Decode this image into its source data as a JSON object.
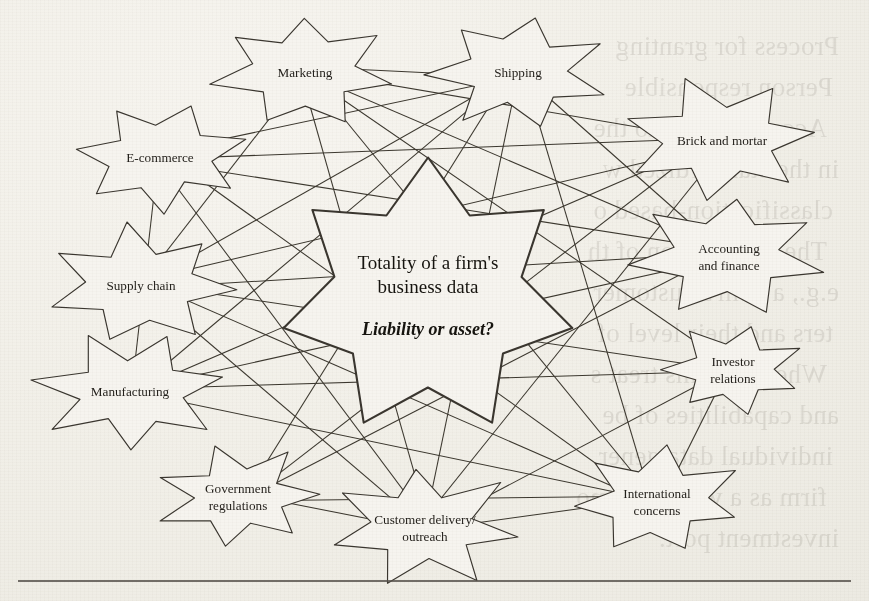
{
  "figure": {
    "kind": "network-diagram",
    "center_node": {
      "line1": "Totality of a firm's",
      "line2": "business data",
      "line3": "Liability or asset?"
    },
    "nodes": [
      {
        "id": "marketing",
        "label_line1": "Marketing",
        "label_line2": "",
        "cx": 305,
        "cy": 72,
        "r_outer": 92,
        "r_inner": 52
      },
      {
        "id": "shipping",
        "label_line1": "Shipping",
        "label_line2": "",
        "cx": 518,
        "cy": 72,
        "r_outer": 92,
        "r_inner": 52
      },
      {
        "id": "ecommerce",
        "label_line1": "E-commerce",
        "label_line2": "",
        "cx": 160,
        "cy": 157,
        "r_outer": 90,
        "r_inner": 50
      },
      {
        "id": "brick",
        "label_line1": "Brick and mortar",
        "label_line2": "",
        "cx": 722,
        "cy": 140,
        "r_outer": 100,
        "r_inner": 56
      },
      {
        "id": "supply",
        "label_line1": "Supply chain",
        "label_line2": "",
        "cx": 141,
        "cy": 285,
        "r_outer": 96,
        "r_inner": 54
      },
      {
        "id": "accounting",
        "label_line1": "Accounting",
        "label_line2": "and finance",
        "cx": 729,
        "cy": 256,
        "r_outer": 96,
        "r_inner": 54
      },
      {
        "id": "investor",
        "label_line1": "Investor",
        "label_line2": "relations",
        "cx": 733,
        "cy": 369,
        "r_outer": 73,
        "r_inner": 41
      },
      {
        "id": "manufacturing",
        "label_line1": "Manufacturing",
        "label_line2": "",
        "cx": 130,
        "cy": 391,
        "r_outer": 94,
        "r_inner": 52
      },
      {
        "id": "government",
        "label_line1": "Government",
        "label_line2": "regulations",
        "cx": 238,
        "cy": 496,
        "r_outer": 82,
        "r_inner": 46
      },
      {
        "id": "customer",
        "label_line1": "Customer delivery/",
        "label_line2": "outreach",
        "cx": 425,
        "cy": 527,
        "r_outer": 98,
        "r_inner": 52
      },
      {
        "id": "international",
        "label_line1": "International",
        "label_line2": "concerns",
        "cx": 657,
        "cy": 501,
        "r_outer": 87,
        "r_inner": 49
      }
    ],
    "center": {
      "cx": 428,
      "cy": 297,
      "r_outer": 148,
      "r_inner": 96
    },
    "edges": [
      [
        "marketing",
        "shipping"
      ],
      [
        "marketing",
        "brick"
      ],
      [
        "marketing",
        "accounting"
      ],
      [
        "marketing",
        "international"
      ],
      [
        "marketing",
        "customer"
      ],
      [
        "marketing",
        "investor"
      ],
      [
        "shipping",
        "ecommerce"
      ],
      [
        "shipping",
        "supply"
      ],
      [
        "shipping",
        "manufacturing"
      ],
      [
        "shipping",
        "customer"
      ],
      [
        "shipping",
        "international"
      ],
      [
        "shipping",
        "government"
      ],
      [
        "ecommerce",
        "brick"
      ],
      [
        "ecommerce",
        "accounting"
      ],
      [
        "ecommerce",
        "international"
      ],
      [
        "ecommerce",
        "customer"
      ],
      [
        "brick",
        "supply"
      ],
      [
        "brick",
        "manufacturing"
      ],
      [
        "brick",
        "customer"
      ],
      [
        "supply",
        "accounting"
      ],
      [
        "supply",
        "international"
      ],
      [
        "supply",
        "investor"
      ],
      [
        "accounting",
        "manufacturing"
      ],
      [
        "accounting",
        "government"
      ],
      [
        "manufacturing",
        "investor"
      ],
      [
        "manufacturing",
        "international"
      ],
      [
        "government",
        "international"
      ],
      [
        "government",
        "customer"
      ],
      [
        "customer",
        "investor"
      ],
      [
        "customer",
        "international"
      ],
      [
        "investor",
        "international"
      ],
      [
        "marketing",
        "supply"
      ],
      [
        "shipping",
        "accounting"
      ],
      [
        "brick",
        "government"
      ],
      [
        "ecommerce",
        "manufacturing"
      ],
      [
        "supply",
        "customer"
      ]
    ],
    "colors": {
      "paper": "#f4f2ec",
      "ink": "#211e19",
      "stroke": "#3a362f",
      "rule": "#55504a"
    }
  },
  "bleed_through": {
    "note": "faint mirrored text showing through from the reverse side of the printed page",
    "lines": [
      "Process for granting",
      "Person responsible",
      "Access control to the",
      "in the standardized w",
      "classification-based o",
      "The aggregation of th",
      "e.g., a firm's customer",
      "ters and their level of",
      "Whereas firms treat s",
      "and capabilities of be",
      "individual data gener",
      "firm as a whole, as mo",
      "investment port."
    ]
  },
  "page_rule": {
    "visible": true
  }
}
